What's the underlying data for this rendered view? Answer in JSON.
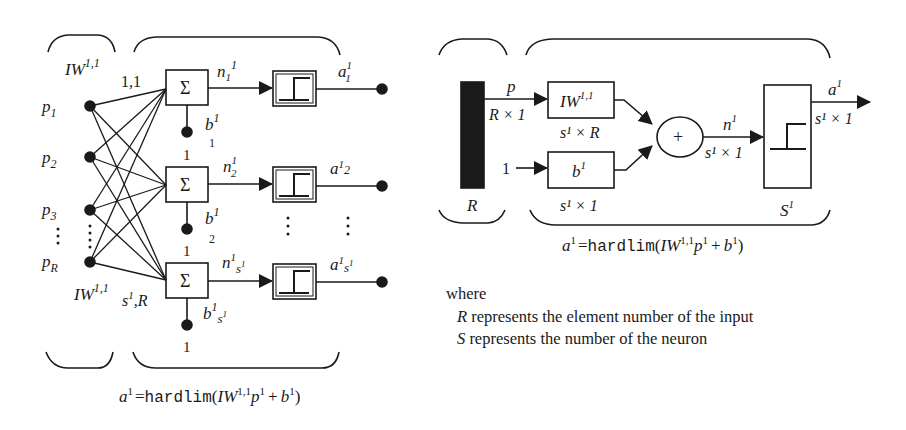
{
  "left_diagram": {
    "inputs": [
      {
        "base": "p",
        "sub": "1"
      },
      {
        "base": "p",
        "sub": "2"
      },
      {
        "base": "p",
        "sub": "3"
      },
      {
        "base": "p",
        "sub": "R"
      }
    ],
    "weight_label_top": {
      "base": "IW",
      "sup": "1,1"
    },
    "weight_label_bottom": {
      "base": "IW",
      "sup": "1,1"
    },
    "first_weight_index": "1,1",
    "last_weight_index": {
      "base": "s",
      "sup": "1",
      "suffix": ",R"
    },
    "summer_symbol": "Σ",
    "bias_input": "1",
    "neurons": [
      {
        "net": {
          "base": "n",
          "sub": "1",
          "sup": "1"
        },
        "bias": {
          "base": "b",
          "sup": "1",
          "sub": "1"
        },
        "out": {
          "base": "a",
          "sup": "1",
          "sub": "1"
        }
      },
      {
        "net": {
          "base": "n",
          "sub": "2",
          "sup": "1"
        },
        "bias": {
          "base": "b",
          "sup": "1",
          "sub": "2"
        },
        "out": {
          "base": "a",
          "sup": "1",
          "sub": "2"
        }
      },
      {
        "net": {
          "base": "n",
          "sub": "s1",
          "sup": "1"
        },
        "bias": {
          "base": "b",
          "sup": "1",
          "sub": "s1"
        },
        "out": {
          "base": "a",
          "sup": "1",
          "sub": "s1"
        }
      }
    ],
    "formula": {
      "lhs": "a",
      "lhs_sup": "1",
      "eq": "=",
      "func": "hardlim",
      "open": "(",
      "w": "IW",
      "w_sup": "1,1",
      "p": "p",
      "p_sup": "1",
      "plus": "+",
      "b": "b",
      "b_sup": "1",
      "close": ")"
    }
  },
  "right_diagram": {
    "input_label": "p",
    "input_dim": "R × 1",
    "input_bar_label": "R",
    "weight_box": {
      "base": "IW",
      "sup": "1,1"
    },
    "weight_dim": "s¹ × R",
    "bias_input": "1",
    "bias_box": {
      "base": "b",
      "sup": "1"
    },
    "bias_dim": "s¹ × 1",
    "sum_symbol": "+",
    "net_label": {
      "base": "n",
      "sup": "1"
    },
    "net_dim": "s¹ × 1",
    "layer_label": {
      "base": "S",
      "sup": "1"
    },
    "out_label": {
      "base": "a",
      "sup": "1"
    },
    "out_dim": "s¹ × 1",
    "formula": {
      "lhs": "a",
      "lhs_sup": "1",
      "eq": "=",
      "func": "hardlim",
      "open": "(",
      "w": "IW",
      "w_sup": "1,1",
      "p": "p",
      "p_sup": "1",
      "plus": "+",
      "b": "b",
      "b_sup": "1",
      "close": ")"
    }
  },
  "legend": {
    "where": "where",
    "items": [
      {
        "symbol": "R",
        "text": " represents the element number of the input"
      },
      {
        "symbol": "S",
        "text": " represents the number of the neuron"
      }
    ]
  },
  "colors": {
    "stroke": "#1a1a1a",
    "background": "#ffffff"
  }
}
